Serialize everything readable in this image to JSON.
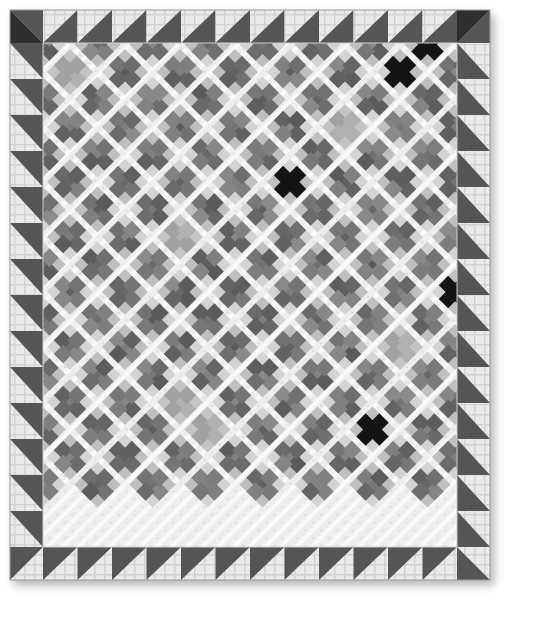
{
  "quilt": {
    "bounds": {
      "x": 10,
      "y": 10,
      "width": 480,
      "height": 570
    },
    "pattern": "Single Irish Chain / on-point nine-patch with sawtooth border",
    "colors": {
      "background": "#ffffff",
      "light_fabric": "#ececec",
      "light_fabric_stripe": "#dcdcdc",
      "sawtooth_dark": "#555555",
      "corner_dark": "#2e2e2e",
      "patch_medium": "#6f6f6f",
      "patch_light_print": "#b5b5b5",
      "patch_dark": "#141414",
      "seam": "#cfcfcf"
    },
    "border": {
      "width": 33,
      "top_triangles": 13,
      "bottom_triangles": 13,
      "side_triangles": 15,
      "corner_blocks": [
        "top-left-dark",
        "top-right-dark",
        "bottom-left-light",
        "bottom-right-light"
      ]
    },
    "field": {
      "x": 43,
      "y": 43,
      "width": 414,
      "height": 504,
      "grid_period": 55,
      "patch_size": 13
    },
    "dark_ninepatches": [
      {
        "cx": 123,
        "cy": 150
      },
      {
        "cx": 297,
        "cy": 192
      },
      {
        "cx": 454,
        "cy": 307
      },
      {
        "cx": 122,
        "cy": 487
      },
      {
        "cx": 358,
        "cy": 432
      },
      {
        "cx": 413,
        "cy": 59
      }
    ],
    "light_print_blocks": [
      {
        "cx": 70,
        "cy": 72
      },
      {
        "cx": 355,
        "cy": 130
      },
      {
        "cx": 170,
        "cy": 240
      },
      {
        "cx": 410,
        "cy": 355
      },
      {
        "cx": 190,
        "cy": 420
      },
      {
        "cx": 80,
        "cy": 520
      }
    ]
  }
}
